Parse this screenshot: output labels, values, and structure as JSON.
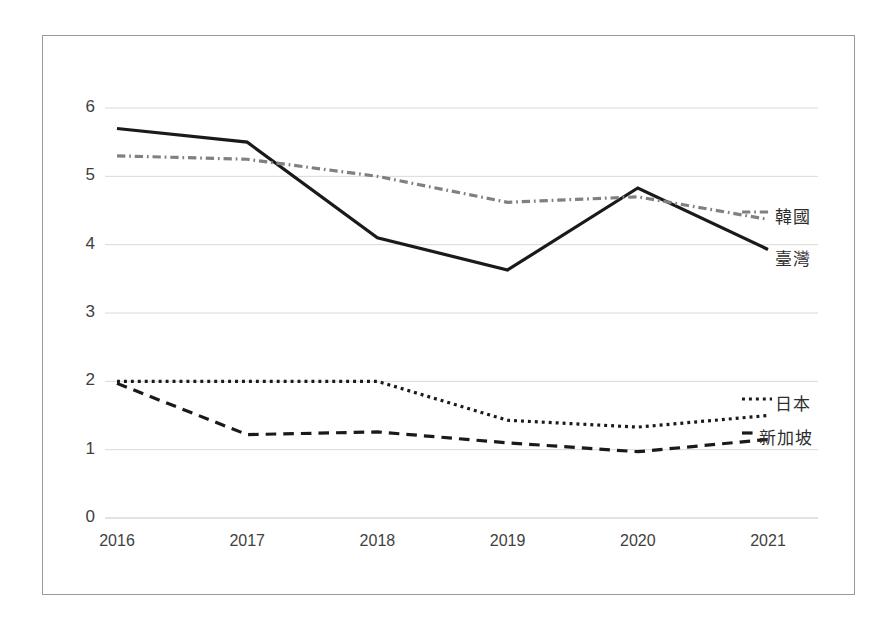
{
  "chart_data": {
    "type": "line",
    "title": "",
    "subtitle": "",
    "xlabel": "",
    "ylabel": "",
    "categories": [
      "2016",
      "2017",
      "2018",
      "2019",
      "2020",
      "2021"
    ],
    "x_tick_labels": [
      "2016",
      "2017",
      "2018",
      "2019",
      "2020",
      "2021"
    ],
    "y_tick_labels": [
      "0",
      "1",
      "2",
      "3",
      "4",
      "5",
      "6"
    ],
    "y_ticks": [
      0,
      1,
      2,
      3,
      4,
      5,
      6
    ],
    "ylim": [
      0,
      6
    ],
    "grid": "horizontal",
    "legend_position": "right-inline-labels",
    "series": [
      {
        "name": "臺灣",
        "label": "臺灣",
        "style": "solid",
        "color": "#1a1a1a",
        "width": 3.2,
        "values": [
          5.7,
          5.5,
          4.1,
          3.63,
          4.83,
          3.93
        ]
      },
      {
        "name": "韓國",
        "label": "韓國",
        "style": "dashdot",
        "color": "#808080",
        "width": 3.2,
        "values": [
          5.3,
          5.25,
          5.0,
          4.62,
          4.7,
          4.37
        ]
      },
      {
        "name": "日本",
        "label": "日本",
        "style": "dotted",
        "color": "#1a1a1a",
        "width": 3.2,
        "values": [
          2.0,
          2.0,
          2.0,
          1.43,
          1.33,
          1.5
        ]
      },
      {
        "name": "新加坡",
        "label": "新加坡",
        "style": "dashed",
        "color": "#1a1a1a",
        "width": 3.2,
        "values": [
          1.97,
          1.22,
          1.26,
          1.1,
          0.97,
          1.15
        ]
      }
    ],
    "colors": {
      "axis": "#3f3f3f",
      "grid": "#d9d9d9",
      "frame": "#9a9a9a",
      "background": "#ffffff"
    }
  },
  "series_labels": {
    "korea": "韓國",
    "taiwan": "臺灣",
    "japan": "日本",
    "singapore": "新加坡"
  }
}
